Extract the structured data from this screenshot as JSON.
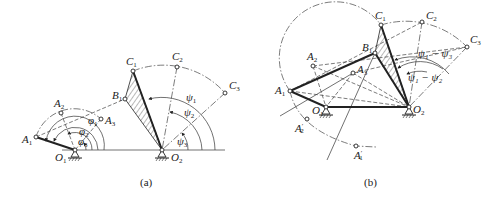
{
  "figure_a": {
    "caption": "(a)",
    "points": {
      "A1": "A",
      "A2": "A",
      "A3": "A",
      "B1": "B",
      "C1": "C",
      "C2": "C",
      "C3": "C",
      "O1": "O",
      "O2": "O"
    },
    "labels": {
      "A1": {
        "main": "A",
        "sub": "1"
      },
      "A2": {
        "main": "A",
        "sub": "2"
      },
      "A3": {
        "main": "A",
        "sub": "3"
      },
      "B1": {
        "main": "B",
        "sub": "1"
      },
      "C1": {
        "main": "C",
        "sub": "1"
      },
      "C2": {
        "main": "C",
        "sub": "2"
      },
      "C3": {
        "main": "C",
        "sub": "3"
      },
      "O1": {
        "main": "O",
        "sub": "1"
      },
      "O2": {
        "main": "O",
        "sub": "2"
      },
      "phi1": {
        "main": "φ",
        "sub": "1"
      },
      "phi2": {
        "main": "φ",
        "sub": "2"
      },
      "phi3": {
        "main": "φ",
        "sub": "3"
      },
      "psi1": {
        "main": "ψ",
        "sub": "1"
      },
      "psi2": {
        "main": "ψ",
        "sub": "2"
      },
      "psi3": {
        "main": "ψ",
        "sub": "3"
      }
    }
  },
  "figure_b": {
    "caption": "(b)",
    "labels": {
      "A1": {
        "main": "A",
        "sub": "1"
      },
      "A2": {
        "main": "A",
        "sub": "2"
      },
      "A3": {
        "main": "A",
        "sub": "3"
      },
      "A1p": {
        "main": "A",
        "sub": "1",
        "prime": "′"
      },
      "A2p": {
        "main": "A",
        "sub": "2",
        "prime": "′"
      },
      "B1": {
        "main": "B",
        "sub": "1"
      },
      "C1": {
        "main": "C",
        "sub": "1"
      },
      "C2": {
        "main": "C",
        "sub": "2"
      },
      "C3": {
        "main": "C",
        "sub": "3"
      },
      "O1": {
        "main": "O",
        "sub": "1"
      },
      "O2": {
        "main": "O",
        "sub": "2"
      },
      "psi1_psi3": "ψ₁ − ψ₃",
      "psi1_psi2": "ψ₁ − ψ₂"
    }
  }
}
